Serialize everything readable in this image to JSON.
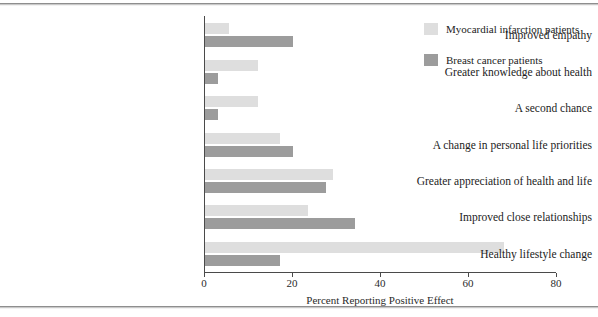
{
  "chart_data": {
    "type": "bar",
    "orientation": "horizontal",
    "title": "",
    "xlabel": "Percent Reporting Positive Effect",
    "ylabel": "",
    "xlim": [
      0,
      80
    ],
    "xticks": [
      0,
      20,
      40,
      60,
      80
    ],
    "xtick_labels": [
      "0",
      "20",
      "40",
      "60",
      "80"
    ],
    "grid": false,
    "legend_position": "top-right",
    "categories": [
      "Improved empathy",
      "Greater knowledge about health",
      "A second chance",
      "A change in personal life priorities",
      "Greater appreciation of health and life",
      "Improved close relationships",
      "Healthy lifestyle change"
    ],
    "series": [
      {
        "name": "Myocardial infarction patients",
        "color": "#dedede",
        "values": [
          5.5,
          12,
          12,
          17,
          29,
          23.5,
          68
        ]
      },
      {
        "name": "Breast cancer patients",
        "color": "#9c9c9c",
        "values": [
          20,
          3,
          3,
          20,
          27.5,
          34,
          17
        ]
      }
    ]
  },
  "legend": {
    "items": [
      {
        "label": "Myocardial infarction patients",
        "swatch": "light"
      },
      {
        "label": "Breast cancer patients",
        "swatch": "dark"
      }
    ]
  },
  "axis": {
    "x_title": "Percent Reporting Positive Effect"
  }
}
